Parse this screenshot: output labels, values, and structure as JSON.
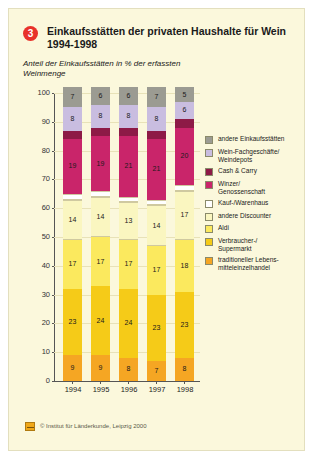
{
  "card": {
    "badge_number": "3",
    "title": "Einkaufsstätten der privaten Haushalte für Wein 1994-1998",
    "subtitle": "Anteil der Einkaufsstätten in % der erfassten Weinmenge",
    "credit": "© Institut für Länderkunde, Leipzig 2000",
    "credit_icon": "ifl-logo-icon"
  },
  "chart_data": {
    "type": "bar",
    "stacked": true,
    "title": "Einkaufsstätten der privaten Haushalte für Wein 1994-1998",
    "subtitle": "Anteil der Einkaufsstätten in % der erfassten Weinmenge",
    "xlabel": "",
    "ylabel": "%",
    "ylim": [
      0,
      100
    ],
    "yticks": [
      0,
      10,
      20,
      30,
      40,
      50,
      60,
      70,
      80,
      90,
      100
    ],
    "grid": true,
    "legend_position": "right",
    "categories": [
      "1994",
      "1995",
      "1996",
      "1997",
      "1998"
    ],
    "series": [
      {
        "name": "traditioneller Lebens-mitteleinzelhandel",
        "color": "#f5a623",
        "values": [
          9,
          9,
          8,
          7,
          8
        ],
        "labels": [
          "9",
          "9",
          "8",
          "7",
          "8"
        ]
      },
      {
        "name": "Verbraucher-/ Supermarkt",
        "color": "#f5cb18",
        "values": [
          23,
          24,
          24,
          23,
          23
        ],
        "labels": [
          "23",
          "24",
          "24",
          "23",
          "23"
        ]
      },
      {
        "name": "Aldi",
        "color": "#fbe95e",
        "values": [
          17,
          17,
          17,
          17,
          18
        ],
        "labels": [
          "17",
          "17",
          "17",
          "17",
          "18"
        ]
      },
      {
        "name": "andere Discounter",
        "color": "#faf6c0",
        "values": [
          14,
          14,
          13,
          14,
          17
        ],
        "labels": [
          "14",
          "14",
          "13",
          "14",
          "17"
        ]
      },
      {
        "name": "Kauf-/Warenhaus",
        "color": "#ffffff",
        "values": [
          2,
          2,
          2,
          2,
          2
        ],
        "labels": [
          "",
          "",
          "",
          "",
          ""
        ]
      },
      {
        "name": "Winzer/ Genossenschaft",
        "color": "#c9256a",
        "values": [
          19,
          19,
          21,
          21,
          20
        ],
        "labels": [
          "19",
          "19",
          "21",
          "21",
          "20"
        ]
      },
      {
        "name": "Cash & Carry",
        "color": "#8d1a46",
        "values": [
          3,
          3,
          3,
          3,
          3
        ],
        "labels": [
          "",
          "",
          "",
          "",
          ""
        ]
      },
      {
        "name": "Wein-Fachgeschäfte/ Weindepots",
        "color": "#c9bde0",
        "values": [
          8,
          8,
          8,
          8,
          6
        ],
        "labels": [
          "8",
          "8",
          "8",
          "8",
          "6"
        ]
      },
      {
        "name": "andere Einkaufsstätten",
        "color": "#9b9b92",
        "values": [
          7,
          6,
          6,
          7,
          5
        ],
        "labels": [
          "7",
          "6",
          "6",
          "7",
          "5"
        ]
      }
    ]
  },
  "legend": {
    "items": [
      {
        "label": "andere Einkaufsstätten",
        "color": "#9b9b92"
      },
      {
        "label": "Wein-Fachgeschäfte/\nWeindepots",
        "color": "#c9bde0"
      },
      {
        "label": "Cash & Carry",
        "color": "#8d1a46"
      },
      {
        "label": "Winzer/\nGenossenschaft",
        "color": "#c9256a"
      },
      {
        "label": "Kauf-/Warenhaus",
        "color": "#ffffff"
      },
      {
        "label": "andere Discounter",
        "color": "#faf6c0"
      },
      {
        "label": "Aldi",
        "color": "#fbe95e"
      },
      {
        "label": "Verbraucher-/\nSupermarkt",
        "color": "#f5cb18"
      },
      {
        "label": "traditioneller Lebens-\nmitteleinzelhandel",
        "color": "#f5a623"
      }
    ]
  }
}
